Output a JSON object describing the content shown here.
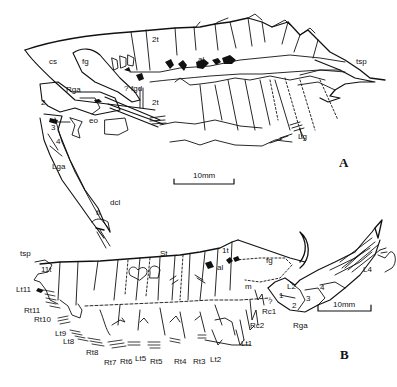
{
  "figure": {
    "panels": [
      {
        "id": "A",
        "letter": "A",
        "scale_bar": "10mm",
        "labels": {
          "cs": "cs",
          "fg": "fg",
          "t2_top": "2t",
          "t2_mid": "2t",
          "al": "al",
          "tsp": "tsp",
          "rga": "Rga",
          "fgd": "fgd",
          "q": "?",
          "eo": "eo",
          "seg2": "2",
          "seg3": "3",
          "seg4": "4",
          "lga": "Lga",
          "dcl": "dcl",
          "tl": "tl",
          "lg": "Lg"
        }
      },
      {
        "id": "B",
        "letter": "B",
        "scale_bar": "10mm",
        "labels": {
          "tsp": "tsp",
          "t11": "11t",
          "st": "St",
          "t1": "1t",
          "al": "al",
          "fg": "fg",
          "m": "m",
          "l2": "L2",
          "l4": "L4",
          "seg1": "1",
          "seg2": "2",
          "seg3": "3",
          "seg4": "4",
          "rga": "Rga",
          "rc1": "Rc1",
          "rc2": "Rc2",
          "q": "?",
          "lt11": "Lt11",
          "rt11": "Rt11",
          "rt10": "Rt10",
          "lt9": "Lt9",
          "lt8": "Lt8",
          "rt8": "Rt8",
          "rt7": "Rt7",
          "rt6": "Rt6",
          "lt5": "Lt5",
          "rt5": "Rt5",
          "rt4": "Rt4",
          "rt3": "Rt3",
          "lt2": "Lt2",
          "lt1": "Lt1"
        }
      }
    ]
  }
}
